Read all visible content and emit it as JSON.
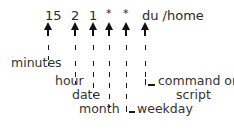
{
  "diagram": {
    "command_line": {
      "fields": [
        {
          "id": "minute",
          "text": "15"
        },
        {
          "id": "hour",
          "text": "2"
        },
        {
          "id": "date",
          "text": "1"
        },
        {
          "id": "month",
          "text": "*"
        },
        {
          "id": "weekday",
          "text": "*"
        },
        {
          "id": "command",
          "text": "du /home"
        }
      ]
    },
    "labels": {
      "minutes": "minutes",
      "hour": "hour",
      "date": "date",
      "month": "month",
      "weekday": "weekday",
      "command_line1": "command or",
      "command_line2": "script"
    }
  }
}
